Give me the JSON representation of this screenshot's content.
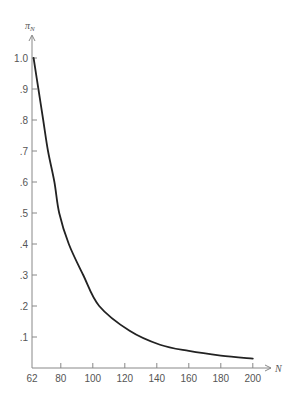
{
  "chart_data": {
    "type": "line",
    "title": "",
    "xlabel": "N",
    "ylabel": "π_N",
    "xlim": [
      62,
      200
    ],
    "ylim": [
      0,
      1.0
    ],
    "x_ticks": [
      62,
      80,
      100,
      120,
      140,
      160,
      180,
      200
    ],
    "x_tick_labels": [
      "62",
      "80",
      "100",
      "120",
      "140",
      "160",
      "180",
      "200"
    ],
    "y_ticks": [
      0.1,
      0.2,
      0.3,
      0.4,
      0.5,
      0.6,
      0.7,
      0.8,
      0.9,
      1.0
    ],
    "y_tick_labels": [
      ".1",
      ".2",
      ".3",
      ".4",
      ".5",
      ".6",
      ".7",
      ".8",
      ".9",
      "1.0"
    ],
    "grid": false,
    "legend": null,
    "series": [
      {
        "name": "π_N",
        "color": "#222222",
        "x": [
          63,
          66,
          69,
          72,
          76,
          79,
          85,
          94,
          104,
          123,
          142,
          160,
          180,
          200
        ],
        "y": [
          1.0,
          0.9,
          0.8,
          0.7,
          0.6,
          0.5,
          0.4,
          0.3,
          0.2,
          0.12,
          0.075,
          0.055,
          0.04,
          0.03
        ]
      }
    ]
  },
  "labels": {
    "y_axis_title_main": "π",
    "y_axis_title_sub": "N",
    "x_axis_title": "N"
  },
  "colors": {
    "axis": "#888888",
    "text": "#555555",
    "curve": "#222222"
  }
}
